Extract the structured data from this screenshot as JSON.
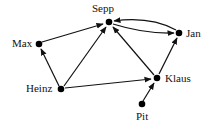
{
  "diagram": {
    "type": "directed-graph",
    "nodes": [
      {
        "id": "sepp",
        "label": "Sepp",
        "x": 109,
        "y": 22
      },
      {
        "id": "jan",
        "label": "Jan",
        "x": 179,
        "y": 33
      },
      {
        "id": "max",
        "label": "Max",
        "x": 39,
        "y": 44
      },
      {
        "id": "heinz",
        "label": "Heinz",
        "x": 61,
        "y": 89
      },
      {
        "id": "klaus",
        "label": "Klaus",
        "x": 157,
        "y": 78
      },
      {
        "id": "pit",
        "label": "Pit",
        "x": 142,
        "y": 104
      }
    ],
    "edges": [
      {
        "from": "Max",
        "to": "Sepp"
      },
      {
        "from": "Heinz",
        "to": "Max"
      },
      {
        "from": "Heinz",
        "to": "Sepp"
      },
      {
        "from": "Heinz",
        "to": "Klaus"
      },
      {
        "from": "Klaus",
        "to": "Sepp"
      },
      {
        "from": "Klaus",
        "to": "Jan"
      },
      {
        "from": "Pit",
        "to": "Klaus"
      },
      {
        "from": "Sepp",
        "to": "Jan"
      },
      {
        "from": "Jan",
        "to": "Sepp"
      }
    ],
    "colors": {
      "stroke": "#111111",
      "node": "#000000",
      "background": "#ffffff"
    }
  }
}
